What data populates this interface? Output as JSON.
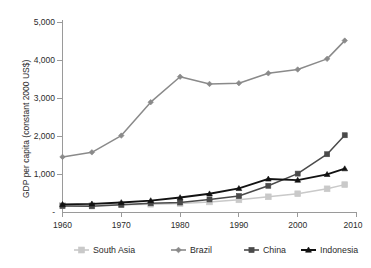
{
  "chart_data": {
    "type": "line",
    "title": "",
    "subtitle": "",
    "xlabel": "",
    "ylabel": "GDP per capita (constant 2000 US$)",
    "xlim": [
      1960,
      2010
    ],
    "ylim": [
      0,
      5000
    ],
    "grid": false,
    "legend_position": "bottom",
    "x_ticks": [
      "1960",
      "1970",
      "1980",
      "1990",
      "2000",
      "2010"
    ],
    "x_tick_values": [
      1960,
      1970,
      1980,
      1990,
      2000,
      2010
    ],
    "y_ticks": [
      "-",
      "1,000",
      "2,000",
      "3,000",
      "4,000",
      "5,000"
    ],
    "y_tick_values": [
      0,
      1000,
      2000,
      3000,
      4000,
      5000
    ],
    "x": [
      1960,
      1965,
      1970,
      1975,
      1980,
      1985,
      1990,
      1995,
      2000,
      2005,
      2008
    ],
    "series": [
      {
        "name": "South Asia",
        "color": "#c9c9c9",
        "marker": "square",
        "values": [
          170,
          175,
          190,
          205,
          225,
          265,
          320,
          400,
          480,
          610,
          720
        ]
      },
      {
        "name": "Brazil",
        "color": "#8a8a8a",
        "marker": "diamond",
        "values": [
          1450,
          1570,
          2010,
          2890,
          3560,
          3370,
          3390,
          3650,
          3750,
          4030,
          4510
        ]
      },
      {
        "name": "China",
        "color": "#4a4a4a",
        "marker": "square",
        "values": [
          160,
          150,
          190,
          230,
          250,
          330,
          420,
          690,
          1010,
          1520,
          2020
        ]
      },
      {
        "name": "Indonesia",
        "color": "#121212",
        "marker": "triangle",
        "values": [
          200,
          215,
          250,
          300,
          380,
          480,
          620,
          870,
          840,
          990,
          1140
        ]
      }
    ]
  },
  "legend": {
    "items": [
      {
        "label": "South Asia"
      },
      {
        "label": "Brazil"
      },
      {
        "label": "China"
      },
      {
        "label": "Indonesia"
      }
    ]
  },
  "axes": {
    "y_title": "GDP per capita (constant 2000 US$)"
  }
}
